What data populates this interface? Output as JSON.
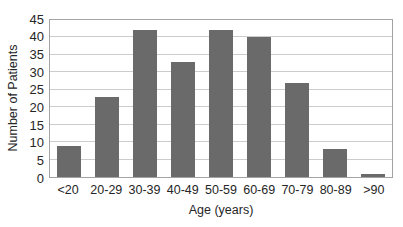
{
  "chart_data": {
    "type": "bar",
    "title": "",
    "xlabel": "Age (years)",
    "ylabel": "Number of Patients",
    "categories": [
      "<20",
      "20-29",
      "30-39",
      "40-49",
      "50-59",
      "60-69",
      "70-79",
      "80-89",
      ">90"
    ],
    "values": [
      9,
      23,
      42,
      33,
      42,
      40,
      27,
      8,
      1
    ],
    "ylim": [
      0,
      45
    ],
    "yticks": [
      0,
      5,
      10,
      15,
      20,
      25,
      30,
      35,
      40,
      45
    ],
    "grid": true,
    "legend": "none",
    "colors": {
      "bar": "#6a6a6a",
      "gridline": "#cccccc",
      "plot_border": "#a3a3a3",
      "text": "#262626",
      "background": "#ffffff"
    }
  }
}
